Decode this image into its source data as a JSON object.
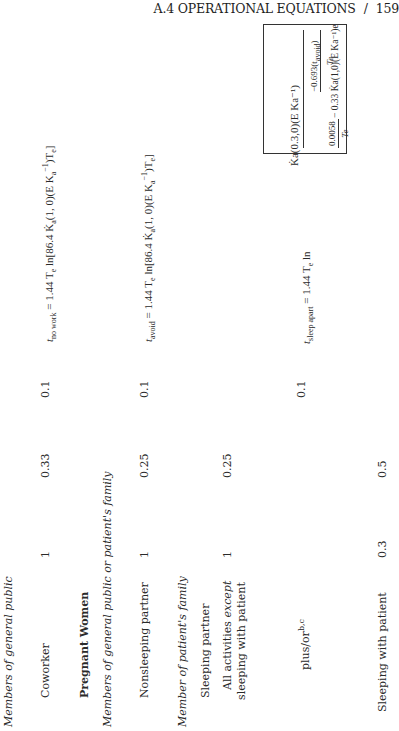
{
  "header": {
    "section": "A.4 OPERATIONAL EQUATIONS",
    "separator": "/",
    "page_number": "159"
  },
  "table": {
    "rows": [
      {
        "type": "subgroup",
        "label": "Members of general public"
      },
      {
        "type": "data",
        "label": "Coworker",
        "col1": "1",
        "col2": "0.33",
        "col3": "0.1",
        "equation": {
          "lhs": "t",
          "lhs_sub": "no work",
          "rhs_a": "= 1.44 T",
          "rhs_a_sub": "e",
          "rhs_b": " ln[86.4 K̇",
          "rhs_b_sub": "a",
          "rhs_c": "(1, 0)(E K",
          "rhs_c_sub": "a",
          "rhs_c_sup": "−1",
          "rhs_d": ")T",
          "rhs_d_sub": "e",
          "rhs_e": "]"
        }
      },
      {
        "type": "group",
        "label": "Pregnant Women"
      },
      {
        "type": "subgroup",
        "label": "Members of general public or patient's family"
      },
      {
        "type": "data",
        "label": "Nonsleeping partner",
        "col1": "1",
        "col2": "0.25",
        "col3": "0.1",
        "equation": {
          "lhs": "t",
          "lhs_sub": "avoid",
          "rhs_a": "= 1.44 T",
          "rhs_a_sub": "e",
          "rhs_b": " ln[86.4 K̇",
          "rhs_b_sub": "a",
          "rhs_c": "(1, 0)(E K",
          "rhs_c_sub": "a",
          "rhs_c_sup": "−1",
          "rhs_d": ")T",
          "rhs_d_sub": "e",
          "rhs_e": "]"
        }
      },
      {
        "type": "subgroup",
        "label": "Member of patient's family"
      },
      {
        "type": "plain",
        "label": "Sleeping partner"
      },
      {
        "type": "data",
        "label_line1": "All activities ",
        "label_line1_it": "except",
        "label_line2": "sleeping with patient",
        "col1": "1",
        "col2": "0.25"
      },
      {
        "type": "data",
        "label": "plus/or",
        "label_sup": "b,c",
        "col3": "0.1",
        "equation": {
          "lhs": "t",
          "lhs_sub": "sleep apart",
          "rhs_a": "= 1.44 T",
          "rhs_a_sub": "e",
          "ln": " ln",
          "numerator": "K̇a(0.3,0)(E Ka⁻¹)",
          "inner_num": "−0.693(t",
          "inner_num_sub": "avoid",
          "inner_num_end": ")",
          "inner_den": "Te",
          "denominator_a_num": "0.0058",
          "denominator_a_den": "Te",
          "denominator_b": "− 0.33 K̇a(1,0)(E Ka⁻¹)e"
        }
      },
      {
        "type": "data",
        "label": "Sleeping with patient",
        "col1": "0.3",
        "col2": "0.5"
      }
    ]
  }
}
